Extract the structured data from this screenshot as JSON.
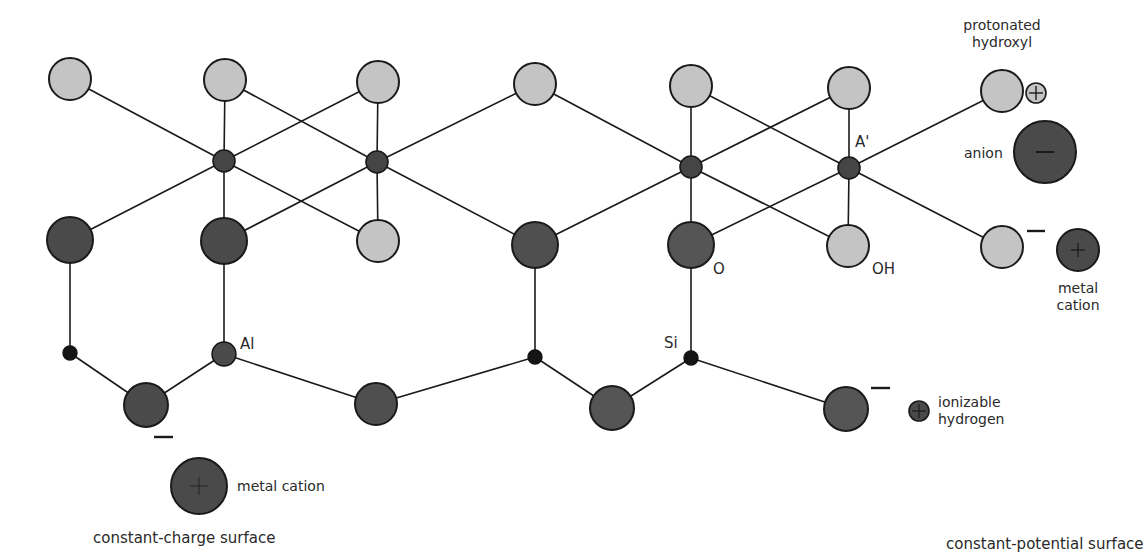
{
  "colors": {
    "light_atom": "#c4c4c4",
    "dark_atom": "#4f4f4f",
    "node": "#444444",
    "stroke": "#1a1a1a",
    "background": "#ffffff"
  },
  "labels": {
    "al_lower": "Al",
    "al_upper": "A'",
    "si": "Si",
    "o": "O",
    "oh": "OH",
    "protonated_hydroxyl_line1": "protonated",
    "protonated_hydroxyl_line2": "hydroxyl",
    "anion": "anion",
    "metal_cation_right_line1": "metal",
    "metal_cation_right_line2": "cation",
    "ionizable_hydrogen_line1": "ionizable",
    "ionizable_hydrogen_line2": "hydrogen",
    "metal_cation_left": "metal cation",
    "constant_charge_surface": "constant-charge surface",
    "constant_potential_surface": "constant-potential surface",
    "minus_sign": "−"
  },
  "structure": {
    "top_oxygens_light": [
      [
        70,
        79
      ],
      [
        225,
        80
      ],
      [
        378,
        82
      ],
      [
        535,
        84
      ],
      [
        691,
        86
      ],
      [
        849,
        88
      ]
    ],
    "octahedral_nodes": [
      [
        224,
        161
      ],
      [
        377,
        162
      ],
      [
        691,
        167
      ],
      [
        849,
        168
      ]
    ],
    "middle_dark": [
      [
        70,
        240
      ],
      [
        224,
        241
      ],
      [
        535,
        245
      ],
      [
        691,
        245
      ]
    ],
    "middle_light": [
      [
        378,
        241
      ],
      [
        848,
        246
      ],
      [
        1002,
        247
      ]
    ],
    "tetrahedral_nodes": [
      [
        70,
        353
      ],
      [
        224,
        354
      ],
      [
        535,
        357
      ],
      [
        691,
        358
      ]
    ],
    "bottom_dark": [
      [
        146,
        405
      ],
      [
        376,
        404
      ],
      [
        612,
        408
      ],
      [
        846,
        409
      ]
    ]
  }
}
